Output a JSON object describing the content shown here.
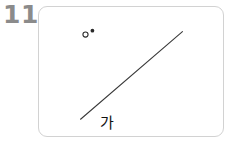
{
  "page": {
    "background_color": "#ffffff",
    "width": 229,
    "height": 142
  },
  "problem": {
    "number": "11",
    "number_color": "#8b8b8b"
  },
  "figure_card": {
    "background_color": "#ffffff",
    "border_color": "#d2d2d2",
    "corner_radius": 9
  },
  "figure": {
    "stroke_color": "#3a3a3a",
    "marker_color": "#2a2a2a",
    "label_color": "#111111",
    "vertex_label": "가",
    "markers": [
      {
        "name": "hollow-circle-marker",
        "shape": "circle-outline",
        "x": 47,
        "y": 28,
        "radius": 2.6
      },
      {
        "name": "filled-dot-marker",
        "shape": "circle-filled",
        "x": 54,
        "y": 24,
        "radius": 1.9
      }
    ],
    "ray": {
      "name": "diagonal-ray",
      "x1": 42,
      "y1": 114,
      "x2": 145,
      "y2": 25,
      "stroke_width": 1.1
    }
  }
}
